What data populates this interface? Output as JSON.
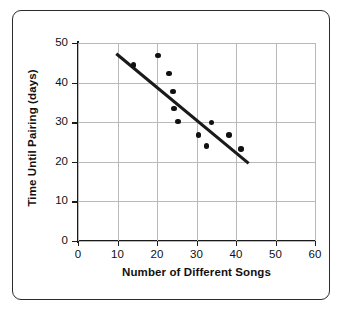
{
  "chart_data": {
    "type": "scatter",
    "title": "",
    "xlabel": "Number of Different Songs",
    "ylabel": "Time Until Pairing (days)",
    "xlim": [
      0,
      60
    ],
    "ylim": [
      0,
      50
    ],
    "xticks": [
      0,
      10,
      20,
      30,
      40,
      50,
      60
    ],
    "yticks": [
      0,
      10,
      20,
      30,
      40,
      50
    ],
    "xtick_labels": [
      "0",
      "10",
      "20",
      "30",
      "40",
      "50",
      "60"
    ],
    "ytick_labels": [
      "0",
      "10",
      "20",
      "30",
      "40",
      "50"
    ],
    "grid": true,
    "legend": null,
    "points": [
      {
        "x": 14.0,
        "y": 44.5
      },
      {
        "x": 20.3,
        "y": 46.8
      },
      {
        "x": 23.0,
        "y": 42.3
      },
      {
        "x": 24.0,
        "y": 37.8
      },
      {
        "x": 24.3,
        "y": 33.5
      },
      {
        "x": 25.3,
        "y": 30.2
      },
      {
        "x": 30.5,
        "y": 26.8
      },
      {
        "x": 32.5,
        "y": 24.0
      },
      {
        "x": 33.8,
        "y": 29.9
      },
      {
        "x": 38.3,
        "y": 26.8
      },
      {
        "x": 41.3,
        "y": 23.2
      }
    ],
    "trend_line": {
      "label": "line of best fit",
      "x0": 9.7,
      "y0": 47.3,
      "x1": 43.2,
      "y1": 19.6
    },
    "colors": {
      "point": "#111111",
      "trend_line": "#1a1a1a",
      "axis": "#1a1a1a",
      "grid": "#b9b9b9",
      "frame": "#2b2b2b",
      "background": "#ffffff"
    }
  }
}
